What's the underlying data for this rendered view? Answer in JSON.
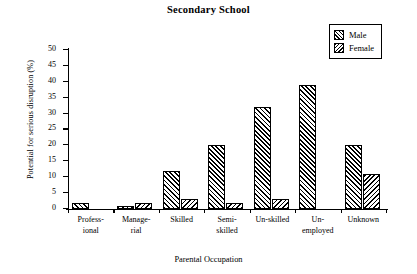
{
  "chart_data": {
    "type": "bar",
    "title": "Secondary School",
    "xlabel": "Parental Occupation",
    "ylabel": "Potential for serious disruption (%)",
    "categories": [
      "Profess-\nional",
      "Manage-\nrial",
      "Skilled",
      "Semi-\nskilled",
      "Un-skilled",
      "Un-\nemployed",
      "Unknown"
    ],
    "category_lines": [
      [
        "Profess-",
        "ional"
      ],
      [
        "Manage-",
        "rial"
      ],
      [
        "Skilled",
        ""
      ],
      [
        "Semi-",
        "skilled"
      ],
      [
        "Un-skilled",
        ""
      ],
      [
        "Un-",
        "employed"
      ],
      [
        "Unknown",
        ""
      ]
    ],
    "series": [
      {
        "name": "Male",
        "values": [
          2,
          1,
          12,
          20,
          32,
          39,
          20
        ]
      },
      {
        "name": "Female",
        "values": [
          0,
          2,
          3,
          2,
          3,
          0,
          11
        ]
      }
    ],
    "ylim": [
      0,
      50
    ],
    "yticks": [
      0,
      5,
      10,
      15,
      20,
      25,
      30,
      35,
      40,
      45,
      50
    ],
    "ytick_labels": [
      "0",
      "5",
      "10",
      "15",
      "20",
      "25",
      "30",
      "35",
      "40",
      "45",
      "50"
    ],
    "grid": false,
    "legend_position": "top-right",
    "colors": {
      "male": "#000000",
      "female": "#000000",
      "background": "#ffffff"
    }
  },
  "legend": {
    "items": [
      {
        "label": "Male",
        "swatch": "male-hatch-swatch"
      },
      {
        "label": "Female",
        "swatch": "female-hatch-swatch"
      }
    ]
  }
}
